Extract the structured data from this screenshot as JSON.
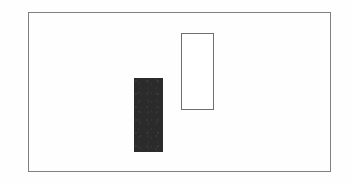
{
  "figure": {
    "canvas": {
      "width": 352,
      "height": 185,
      "background_color": "#fefefe"
    },
    "frame": {
      "name": "outer-frame",
      "x": 28,
      "y": 12,
      "width": 303,
      "height": 160,
      "stroke_color": "#808080",
      "stroke_width": 1.5,
      "fill": "none"
    },
    "shapes": [
      {
        "name": "filled-rectangle",
        "style": "solid",
        "x": 134,
        "y": 78,
        "width": 29,
        "height": 74,
        "fill_color": "#2b2b2b",
        "stroke_color": "none"
      },
      {
        "name": "outlined-rectangle",
        "style": "outline",
        "x": 181,
        "y": 33,
        "width": 33,
        "height": 77,
        "fill_color": "#ffffff",
        "stroke_color": "#6e6e6e",
        "stroke_width": 1.5
      }
    ],
    "labels": [],
    "text": []
  }
}
